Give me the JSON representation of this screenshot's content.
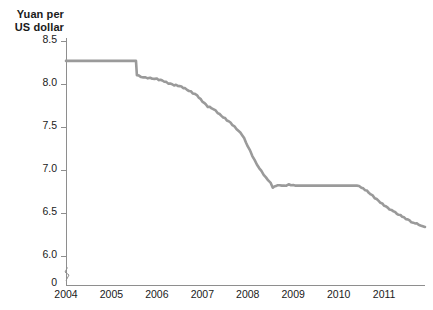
{
  "chart_data": {
    "type": "line",
    "title": "",
    "subtitle": "",
    "ylabel_line1": "Yuan per",
    "ylabel_line2": "US dollar",
    "xlabel": "",
    "ylim": [
      6.0,
      8.5
    ],
    "y_ticks": [
      "8.5",
      "8.0",
      "7.5",
      "7.0",
      "6.5",
      "6.0"
    ],
    "y_tick_values": [
      8.5,
      8.0,
      7.5,
      7.0,
      6.5,
      6.0
    ],
    "zero_tick": "0",
    "axis_break": true,
    "xlim": [
      2004.0,
      2011.9
    ],
    "x_ticks": [
      "2004",
      "2005",
      "2006",
      "2007",
      "2008",
      "2009",
      "2010",
      "2011"
    ],
    "x_tick_values": [
      2004,
      2005,
      2006,
      2007,
      2008,
      2009,
      2010,
      2011
    ],
    "grid": false,
    "legend": null,
    "line_color": "#9a9a9a",
    "axis_color": "#8e8e8e",
    "series": [
      {
        "name": "CNY per USD",
        "x": [
          2004.0,
          2004.25,
          2004.5,
          2004.75,
          2005.0,
          2005.25,
          2005.45,
          2005.54,
          2005.56,
          2005.7,
          2005.85,
          2006.0,
          2006.12,
          2006.25,
          2006.38,
          2006.5,
          2006.62,
          2006.75,
          2006.88,
          2007.0,
          2007.12,
          2007.25,
          2007.38,
          2007.5,
          2007.62,
          2007.75,
          2007.88,
          2008.0,
          2008.1,
          2008.2,
          2008.3,
          2008.4,
          2008.5,
          2008.55,
          2008.62,
          2008.7,
          2008.8,
          2008.9,
          2009.0,
          2009.2,
          2009.4,
          2009.6,
          2009.8,
          2010.0,
          2010.2,
          2010.4,
          2010.5,
          2010.62,
          2010.75,
          2010.88,
          2011.0,
          2011.2,
          2011.4,
          2011.6,
          2011.8,
          2011.9
        ],
        "y": [
          8.28,
          8.28,
          8.28,
          8.28,
          8.28,
          8.28,
          8.28,
          8.28,
          8.11,
          8.09,
          8.08,
          8.07,
          8.05,
          8.02,
          8.0,
          7.99,
          7.96,
          7.92,
          7.88,
          7.81,
          7.75,
          7.72,
          7.66,
          7.61,
          7.56,
          7.49,
          7.42,
          7.29,
          7.18,
          7.08,
          7.0,
          6.92,
          6.86,
          6.8,
          6.83,
          6.84,
          6.83,
          6.84,
          6.83,
          6.83,
          6.83,
          6.83,
          6.83,
          6.83,
          6.83,
          6.83,
          6.81,
          6.77,
          6.71,
          6.65,
          6.6,
          6.53,
          6.47,
          6.41,
          6.37,
          6.35
        ]
      }
    ],
    "annotations": []
  }
}
